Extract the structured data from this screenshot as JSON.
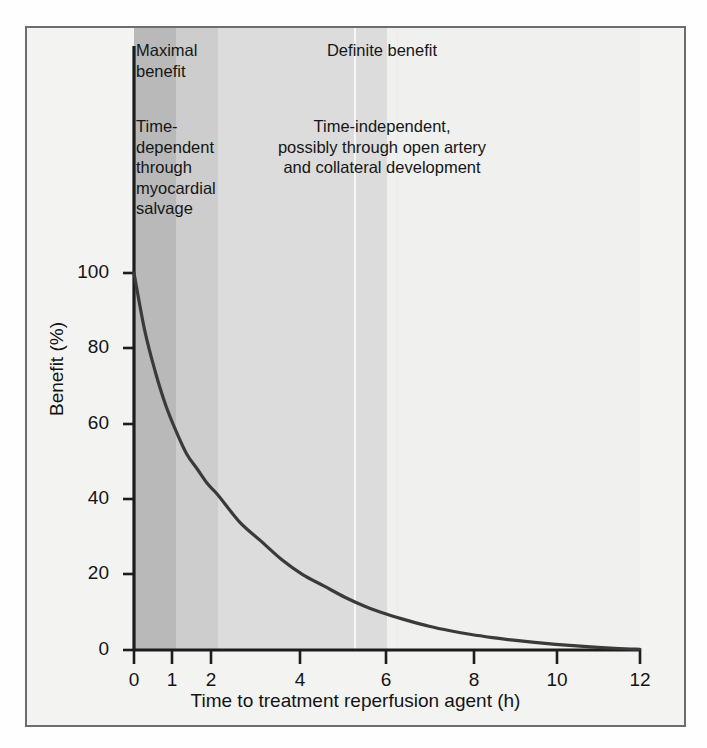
{
  "figure": {
    "frame_border_color": "#6d6d6d",
    "background_color": "#f3f3f2"
  },
  "annotations": {
    "maximal_benefit": "Maximal\nbenefit",
    "time_dependent": "Time-\ndependent\nthrough\nmyocardial\nsalvage",
    "definite_benefit": "Definite benefit",
    "time_independent": "Time-independent,\npossibly through open artery\nand collateral development"
  },
  "chart_data": {
    "type": "line",
    "title": "",
    "xlabel": "Time to treatment reperfusion agent (h)",
    "ylabel": "Benefit (%)",
    "xlim": [
      0,
      12
    ],
    "ylim": [
      0,
      100
    ],
    "xticks": [
      0,
      1,
      2,
      4,
      6,
      8,
      10,
      12
    ],
    "xtick_labels": [
      "0",
      "1",
      "2",
      "4",
      "6",
      "8",
      "10",
      "12"
    ],
    "yticks": [
      0,
      20,
      40,
      60,
      80,
      100
    ],
    "ytick_labels": [
      "0",
      "20",
      "40",
      "60",
      "80",
      "100"
    ],
    "grid": false,
    "legend": "none",
    "series": [
      {
        "name": "Benefit of reperfusion",
        "color": "#2e2e2e",
        "x": [
          0,
          0.25,
          0.5,
          0.75,
          1,
          1.25,
          1.5,
          1.75,
          2,
          2.5,
          3,
          3.5,
          4,
          4.5,
          5,
          5.5,
          6,
          6.5,
          7,
          7.5,
          8,
          8.5,
          9,
          9.5,
          10,
          10.5,
          11,
          11.5,
          12
        ],
        "y": [
          100,
          85,
          74,
          65,
          58,
          52,
          48,
          44,
          41,
          34,
          29,
          24,
          20,
          17,
          14,
          11.5,
          9.5,
          7.8,
          6.3,
          5.1,
          4.1,
          3.3,
          2.6,
          2.0,
          1.5,
          1.1,
          0.7,
          0.4,
          0.2
        ]
      }
    ],
    "shaded_bands": [
      {
        "name": "maximal-benefit-band",
        "x_start": 0,
        "x_end": 1,
        "color": "#b9b9b9"
      },
      {
        "name": "high-benefit-band",
        "x_start": 1,
        "x_end": 2,
        "color": "#cdcdcd"
      },
      {
        "name": "definite-benefit-band",
        "x_start": 2,
        "x_end": 6,
        "color": "#dcdcdc"
      },
      {
        "name": "residual-benefit-band",
        "x_start": 6,
        "x_end": 12,
        "color": "#f0f0ef"
      }
    ]
  }
}
